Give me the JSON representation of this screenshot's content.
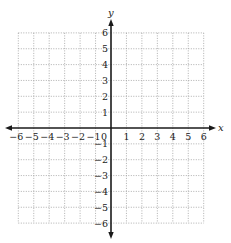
{
  "chart_data": {
    "type": "scatter",
    "title": "",
    "xlabel": "x",
    "ylabel": "y",
    "xlim": [
      -6,
      6
    ],
    "ylim": [
      -6,
      6
    ],
    "grid": true,
    "grid_style": "dotted",
    "x_ticks": [
      -6,
      -5,
      -4,
      -3,
      -2,
      -1,
      1,
      2,
      3,
      4,
      5,
      6
    ],
    "y_ticks": [
      -6,
      -5,
      -4,
      -3,
      -2,
      -1,
      1,
      2,
      3,
      4,
      5,
      6
    ],
    "x_tick_labels": [
      "−6",
      "−5",
      "−4",
      "−3",
      "−2",
      "−1",
      "1",
      "2",
      "3",
      "4",
      "5",
      "6"
    ],
    "y_tick_labels": [
      "−6",
      "−5",
      "−4",
      "−3",
      "−2",
      "−1",
      "1",
      "2",
      "3",
      "4",
      "5",
      "6"
    ],
    "origin_label": "0",
    "series": [],
    "legend": null
  },
  "colors": {
    "axis": "#1a1a1a",
    "grid": "#9a9a9a",
    "text": "#222222",
    "background": "#ffffff"
  }
}
